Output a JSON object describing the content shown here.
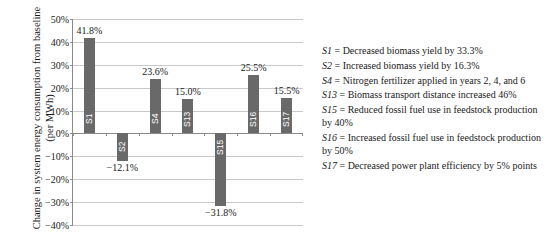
{
  "chart_data": {
    "type": "bar",
    "title": "",
    "xlabel": "",
    "ylabel": "Change in system energy consumption from baseline (per MWh)",
    "categories": [
      "S1",
      "S2",
      "S4",
      "S13",
      "S15",
      "S16",
      "S17"
    ],
    "values": [
      41.8,
      -12.1,
      23.6,
      15.0,
      -31.8,
      25.5,
      15.5
    ],
    "value_labels": [
      "41.8%",
      "−12.1%",
      "23.6%",
      "15.0%",
      "−31.8%",
      "25.5%",
      "15.5%"
    ],
    "ylim": [
      -40,
      50
    ],
    "ytick_values": [
      50,
      40,
      30,
      20,
      10,
      0,
      -10,
      -20,
      -30,
      -40
    ],
    "ytick_labels": [
      "50%",
      "40%",
      "30%",
      "20%",
      "10%",
      "0%",
      "−10%",
      "−20%",
      "−30%",
      "−40%"
    ],
    "grid": true,
    "legend_position": "right-external",
    "bar_color": "#696969",
    "gridline_color": "#c9c9c9",
    "axis_color": "#8a8a8a",
    "background_color": "#ffffff"
  },
  "notes": [
    {
      "id": "S1",
      "eq": "=",
      "text": "Decreased biomass yield by 33.3%"
    },
    {
      "id": "S2",
      "eq": "=",
      "text": "Increased biomass yield by 16.3%"
    },
    {
      "id": "S4",
      "eq": "=",
      "text": "Nitrogen fertilizer applied in years 2, 4, and 6"
    },
    {
      "id": "S13",
      "eq": "=",
      "text": "Biomass transport distance increased 46%"
    },
    {
      "id": "S15",
      "eq": "=",
      "text": "Reduced fossil fuel use in feedstock production by 40%"
    },
    {
      "id": "S16",
      "eq": "=",
      "text": "Increased fossil fuel use in feedstock production by 50%"
    },
    {
      "id": "S17",
      "eq": "=",
      "text": "Decreased power plant efficiency by 5% points"
    }
  ]
}
